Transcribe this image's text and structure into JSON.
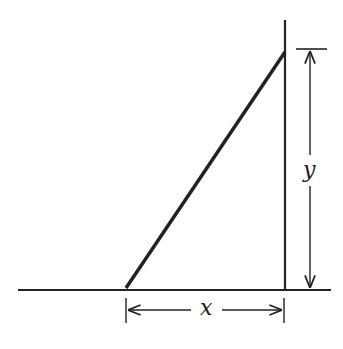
{
  "diagram": {
    "labels": {
      "horizontal": "x",
      "vertical": "y"
    },
    "colors": {
      "stroke": "#222222",
      "background": "#ffffff"
    }
  }
}
